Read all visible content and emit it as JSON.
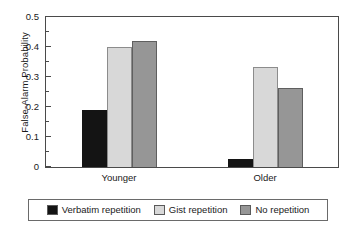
{
  "chart_data": {
    "type": "bar",
    "title": "",
    "xlabel": "",
    "ylabel": "False-Alarm Probability",
    "categories": [
      "Younger",
      "Older"
    ],
    "series": [
      {
        "name": "Verbatim repetition",
        "values": [
          0.19,
          0.027
        ],
        "color": "#141414"
      },
      {
        "name": "Gist repetition",
        "values": [
          0.4,
          0.335
        ],
        "color": "#d8d8d8"
      },
      {
        "name": "No repetition",
        "values": [
          0.42,
          0.265
        ],
        "color": "#969696"
      }
    ],
    "ylim": [
      0,
      0.5
    ],
    "ytick_labels": [
      "0",
      "0.1",
      "0.2",
      "0.3",
      "0.4",
      "0.5"
    ],
    "ytick_values": [
      0,
      0.1,
      0.2,
      0.3,
      0.4,
      0.5
    ],
    "yminor_values": [
      0.05,
      0.15,
      0.25,
      0.35,
      0.45
    ],
    "grid": false,
    "legend_position": "bottom"
  },
  "legend": {
    "items": [
      {
        "label": "Verbatim repetition"
      },
      {
        "label": "Gist repetition"
      },
      {
        "label": "No repetition"
      }
    ]
  }
}
